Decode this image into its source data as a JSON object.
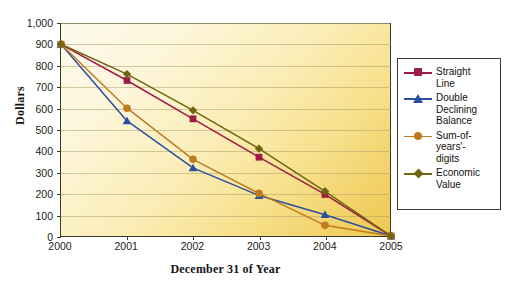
{
  "chart_data": {
    "type": "line",
    "title": "",
    "xlabel": "December 31 of Year",
    "ylabel": "Dollars",
    "categories": [
      "2000",
      "2001",
      "2002",
      "2003",
      "2004",
      "2005"
    ],
    "x": [
      2000,
      2001,
      2002,
      2003,
      2004,
      2005
    ],
    "ylim": [
      0,
      1000
    ],
    "xlim": [
      2000,
      2005
    ],
    "grid": true,
    "legend_position": "right-outside",
    "y_tick_labels": [
      "1,000",
      "900",
      "800",
      "700",
      "600",
      "500",
      "400",
      "300",
      "200",
      "100",
      "0"
    ],
    "y_tick_values": [
      1000,
      900,
      800,
      700,
      600,
      500,
      400,
      300,
      200,
      100,
      0
    ],
    "x_tick_labels": [
      "2000",
      "2001",
      "2002",
      "2003",
      "2004",
      "2005"
    ],
    "series": [
      {
        "name": "Straight Line",
        "legend_label": "Straight\nLine",
        "color": "#9E1B44",
        "marker": "square",
        "values": [
          900,
          730,
          550,
          370,
          195,
          0
        ]
      },
      {
        "name": "Double Declining Balance",
        "legend_label": "Double\nDeclining\nBalance",
        "color": "#2B4FA0",
        "marker": "triangle",
        "values": [
          900,
          540,
          320,
          190,
          100,
          0
        ]
      },
      {
        "name": "Sum-of-years'-digits",
        "legend_label": "Sum-of-\nyears'-\ndigits",
        "color": "#C07A20",
        "marker": "circle",
        "values": [
          900,
          600,
          360,
          200,
          50,
          0
        ]
      },
      {
        "name": "Economic Value",
        "legend_label": "Economic\nValue",
        "color": "#6E6710",
        "marker": "diamond",
        "values": [
          900,
          760,
          590,
          410,
          210,
          0
        ]
      }
    ]
  },
  "colors": {
    "plot_bg_light": "#FDFAEC",
    "plot_bg_dark": "#EEC84F",
    "axis": "#3D3A2A",
    "gridline": "#AEA06E",
    "legend_border": "#3A3A3A",
    "page_bg": "#FFFFFF"
  }
}
